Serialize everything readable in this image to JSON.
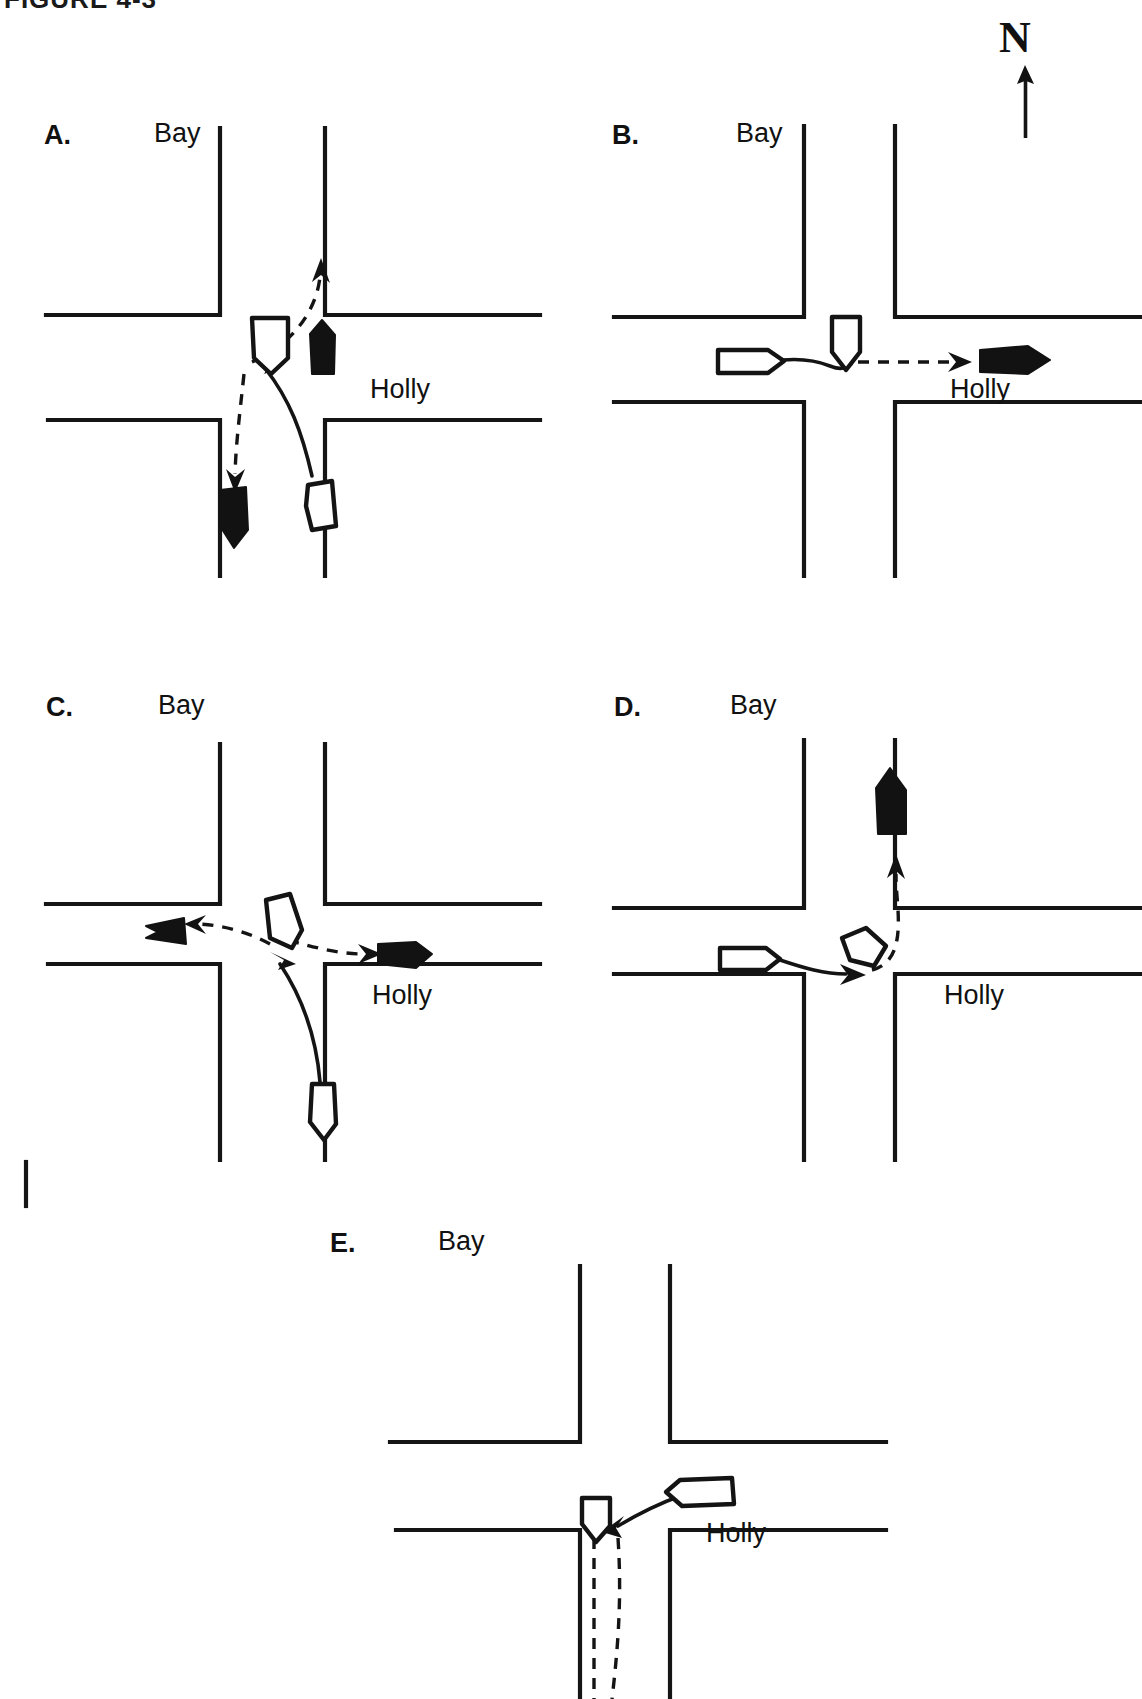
{
  "figure": {
    "caption_partial": "FIGURE 4-3",
    "caption_visible_note": "top edge of caption text cropped by frame"
  },
  "compass": {
    "label": "N",
    "icon": "north-arrow-icon",
    "direction": "up"
  },
  "legend_semantics": {
    "outline_vehicle": "pre-impact vehicle position",
    "solid_vehicle": "post-impact vehicle position",
    "dashed_path": "post-impact travel path",
    "solid_path": "pre-impact travel path"
  },
  "street_names": {
    "vertical": "Bay",
    "horizontal": "Holly"
  },
  "panels": [
    {
      "id": "a",
      "letter": "A.",
      "bay_label": "Bay",
      "holly_label": "Holly",
      "description": "Northbound vehicle turning left from Holly strikes southbound vehicle on Bay; both end up displaced north and south on Bay."
    },
    {
      "id": "b",
      "letter": "B.",
      "bay_label": "Bay",
      "holly_label": "Holly",
      "description": "Eastbound vehicle on Holly strikes southbound vehicle in the intersection; struck vehicle pushed east on Holly."
    },
    {
      "id": "c",
      "letter": "C.",
      "bay_label": "Bay",
      "holly_label": "Holly",
      "description": "Northbound vehicle turning left collides in the intersection; both vehicles come to rest east and west on Holly."
    },
    {
      "id": "d",
      "letter": "D.",
      "bay_label": "Bay",
      "holly_label": "Holly",
      "description": "Eastbound vehicle on Holly strikes vehicle in the intersection which is displaced north on Bay."
    },
    {
      "id": "e",
      "letter": "E.",
      "bay_label": "Bay",
      "holly_label": "Holly",
      "description": "Westbound vehicle on Holly strikes southbound vehicle on Bay; struck vehicle pushed south on Bay (diagram cropped at bottom)."
    }
  ],
  "colors": {
    "ink": "#141414",
    "paper": "#ffffff"
  }
}
